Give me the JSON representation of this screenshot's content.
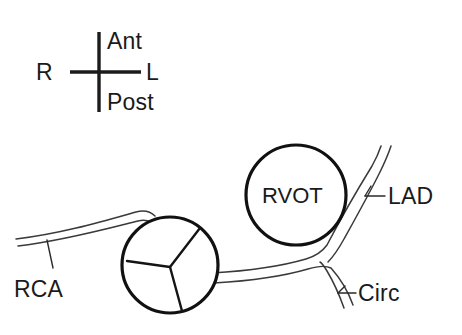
{
  "figure": {
    "background_color": "#ffffff",
    "ink_color": "#111111",
    "vessel_color": "#3a3a3a",
    "width": 462,
    "height": 335
  },
  "orientation_key": {
    "name": "anatomic-orientation-cross",
    "anterior_label": "Ant",
    "posterior_label": "Post",
    "right_label": "R",
    "left_label": "L"
  },
  "structures": {
    "rvot": {
      "label": "RVOT",
      "full_name": "right ventricular outflow tract",
      "shape": "circle",
      "center": [
        296,
        195
      ],
      "radius": 50
    },
    "aortic_valve": {
      "label": "",
      "full_name": "aortic valve with three leaflets",
      "shape": "circle",
      "center": [
        170,
        265
      ],
      "radius": 48,
      "commissure_count": 3
    }
  },
  "vessels": [
    {
      "label": "RCA",
      "full_name": "right coronary artery",
      "origin": "aortic valve, right side",
      "direction": "leftward"
    },
    {
      "label": "LAD",
      "full_name": "left anterior descending artery",
      "origin": "left main bifurcation",
      "direction": "superior-right"
    },
    {
      "label": "Circ",
      "full_name": "circumflex artery",
      "origin": "left main bifurcation",
      "direction": "inferior-right"
    }
  ]
}
